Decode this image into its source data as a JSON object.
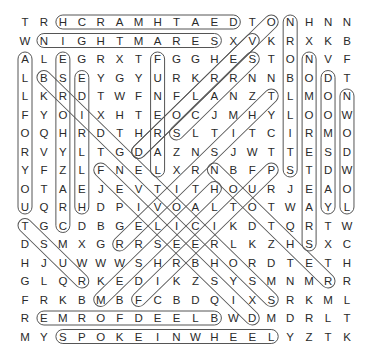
{
  "puzzle": {
    "title": "Word Search",
    "grid": [
      "TRHCRAMHTAEDTONHNN",
      "WNIGHTMARESXVKRXKB",
      "ALEGRXTFGGHESTONVF",
      "LBSEYGYURKRRNNBODT",
      "LKRDTWFNFLANZTLMON",
      "FYOIXHTEOCJMHYLOOW",
      "OQHRDTHRSLTITCIRMO",
      "RVYLTGDAZNSJWTTESD",
      "YFZLFNELXRNBFPSTDW",
      "OTAEJEVTITHOURJEAO",
      "UQRHDPIVOALTOTWAYL",
      "TGCDBGELICIKDTQRTW",
      "DSMXGRRSEERLKZHSXC",
      "HJUWWWSHRBHORDTETH",
      "GLQRKEDIKZSYSMNMRR",
      "FRKBMBFCBDQIXSRKML",
      "REMROFDEELBWDMDRLT",
      "MYSPOKEINWHEELYZTK"
    ],
    "found_words": [
      {
        "word": "DEATHMARCH",
        "start": [
          1,
          3
        ],
        "end": [
          1,
          12
        ]
      },
      {
        "word": "NIGHTMARES",
        "start": [
          2,
          2
        ],
        "end": [
          2,
          11
        ]
      },
      {
        "word": "BLEEDFORME",
        "start": [
          17,
          2
        ],
        "end": [
          17,
          11
        ]
      },
      {
        "word": "SPOKEINWHEEL",
        "start": [
          18,
          3
        ],
        "end": [
          18,
          14
        ]
      },
      {
        "word": "ALLFORYOU",
        "start": [
          3,
          1
        ],
        "end": [
          11,
          1
        ]
      },
      {
        "word": "CRAZYHORSE",
        "start": [
          3,
          3
        ],
        "end": [
          12,
          3
        ]
      },
      {
        "word": "HELLRIDE",
        "start": [
          4,
          4
        ],
        "end": [
          11,
          4
        ]
      },
      {
        "word": "FUNERAL",
        "start": [
          3,
          8
        ],
        "end": [
          9,
          8
        ]
      },
      {
        "word": "STILLBORN",
        "start": [
          1,
          15
        ],
        "end": [
          9,
          15
        ]
      },
      {
        "word": "NOMORETEARS",
        "start": [
          3,
          16
        ],
        "end": [
          13,
          16
        ]
      },
      {
        "word": "DOOMSDAY",
        "start": [
          4,
          17
        ],
        "end": [
          11,
          17
        ]
      },
      {
        "word": "NWODWOL",
        "start": [
          5,
          18
        ],
        "end": [
          11,
          18
        ]
      },
      {
        "word": "OVERLORD",
        "start": [
          1,
          14
        ],
        "end": [
          8,
          7
        ]
      },
      {
        "word": "SCARS",
        "start": [
          3,
          13
        ],
        "end": [
          7,
          9
        ]
      },
      {
        "word": "DISBELIEF",
        "start": [
          9,
          5
        ],
        "end": [
          17,
          13
        ]
      },
      {
        "word": "BRIDGE",
        "start": [
          4,
          2
        ],
        "end": [
          16,
          14
        ]
      },
      {
        "word": "NOOTHER",
        "start": [
          9,
          11
        ],
        "end": [
          15,
          17
        ]
      },
      {
        "word": "WORD-P",
        "start": [
          9,
          14
        ],
        "end": [
          16,
          7
        ]
      },
      {
        "word": "WORD-H",
        "start": [
          10,
          11
        ],
        "end": [
          16,
          5
        ]
      },
      {
        "word": "WORD-R",
        "start": [
          13,
          6
        ],
        "end": [
          5,
          14
        ]
      },
      {
        "word": "WORD-T",
        "start": [
          12,
          1
        ],
        "end": [
          15,
          4
        ]
      },
      {
        "word": "WORD-E",
        "start": [
          2,
          13
        ],
        "end": [
          8,
          7
        ]
      }
    ]
  }
}
